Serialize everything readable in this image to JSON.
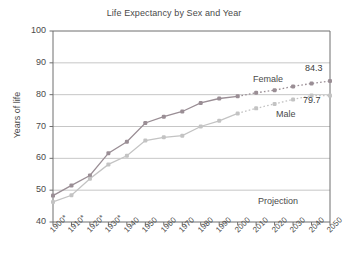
{
  "chart_data": {
    "type": "line",
    "title": "Life Expectancy by Sex and Year",
    "xlabel": "",
    "ylabel": "Years of life",
    "ylim": [
      40,
      100
    ],
    "yticks": [
      40,
      50,
      60,
      70,
      80,
      90,
      100
    ],
    "grid": true,
    "legend_position": "inline-right",
    "categories": [
      "1900*",
      "1910*",
      "1920*",
      "1930*",
      "1940",
      "1950",
      "1960",
      "1970",
      "1980",
      "1990",
      "2000",
      "2010",
      "2020",
      "2030",
      "2040",
      "2050"
    ],
    "x": [
      1900,
      1910,
      1920,
      1930,
      1940,
      1950,
      1960,
      1970,
      1980,
      1990,
      2000,
      2010,
      2020,
      2030,
      2040,
      2050
    ],
    "series": [
      {
        "name": "Female",
        "color": "#9a8e95",
        "values": [
          48.3,
          51.5,
          54.6,
          61.6,
          65.2,
          71.1,
          73.1,
          74.7,
          77.4,
          78.8,
          79.5,
          80.6,
          81.4,
          82.6,
          83.5,
          84.3
        ],
        "projection_from": 2000
      },
      {
        "name": "Male",
        "color": "#c3c3c3",
        "values": [
          46.3,
          48.4,
          53.6,
          58.1,
          60.8,
          65.6,
          66.6,
          67.1,
          70.0,
          71.8,
          74.1,
          75.7,
          77.1,
          78.5,
          79.7,
          79.7
        ],
        "projection_from": 2000
      }
    ],
    "annotations": [
      {
        "name": "female-series-label",
        "text": "Female"
      },
      {
        "name": "male-series-label",
        "text": "Male"
      },
      {
        "name": "female-end-value",
        "text": "84.3"
      },
      {
        "name": "male-end-value",
        "text": "79.7"
      },
      {
        "name": "projection-label",
        "text": "Projection"
      }
    ]
  },
  "labels": {
    "title": "Life Expectancy by Sex and Year",
    "y_axis": "Years of life",
    "female": "Female",
    "male": "Male",
    "female_value": "84.3",
    "male_value": "79.7",
    "projection": "Projection"
  },
  "colors": {
    "female": "#9a8e95",
    "male": "#c3c3c3",
    "axis": "#6e6e6e",
    "grid": "#b8b8b8",
    "text": "#4a4a4a"
  }
}
